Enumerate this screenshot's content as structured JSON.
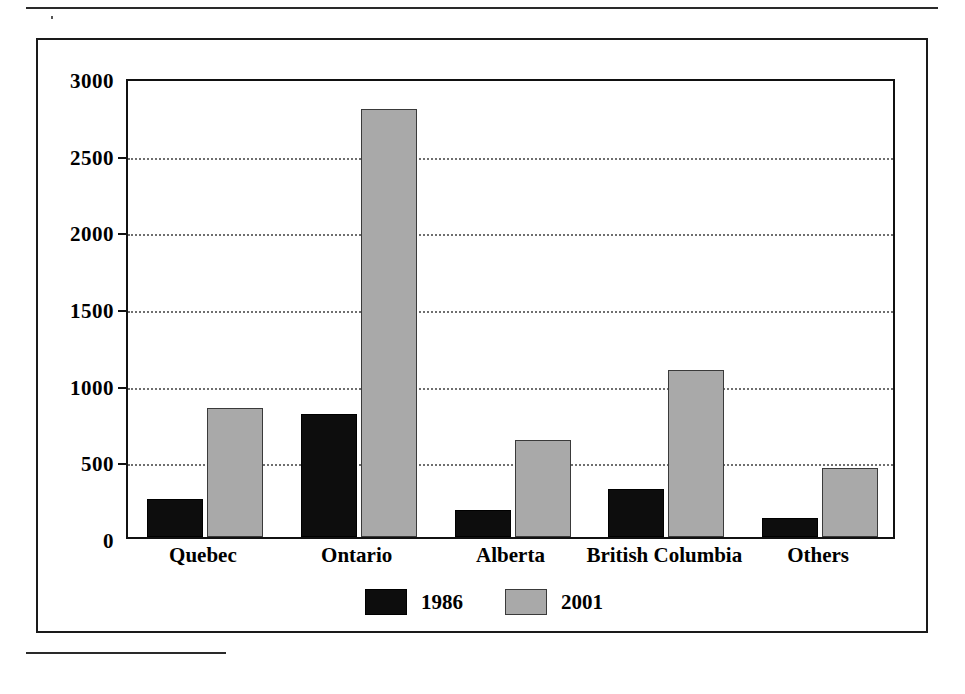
{
  "figure": {
    "frame_border_color": "#1a1a1a",
    "background": "#ffffff"
  },
  "chart_data": {
    "type": "bar",
    "title": "",
    "subtitle": "",
    "xlabel": "",
    "ylabel": "",
    "categories": [
      "Quebec",
      "Ontario",
      "Alberta",
      "British Columbia",
      "Others"
    ],
    "series": [
      {
        "name": "1986",
        "color": "#0d0d0d",
        "values": [
          250,
          800,
          175,
          315,
          125
        ]
      },
      {
        "name": "2001",
        "color": "#a9a9a9",
        "values": [
          840,
          2790,
          630,
          1090,
          450
        ]
      }
    ],
    "ylim": [
      0,
      3000
    ],
    "yticks": [
      0,
      500,
      1000,
      1500,
      2000,
      2500,
      3000
    ],
    "ytick_labels": [
      "0",
      "500",
      "1000",
      "1500",
      "2000",
      "2500",
      "3000"
    ],
    "grid": true,
    "grid_style": "dotted-horizontal",
    "legend_position": "bottom-center",
    "legend_entries": [
      "1986",
      "2001"
    ],
    "annotations": []
  }
}
